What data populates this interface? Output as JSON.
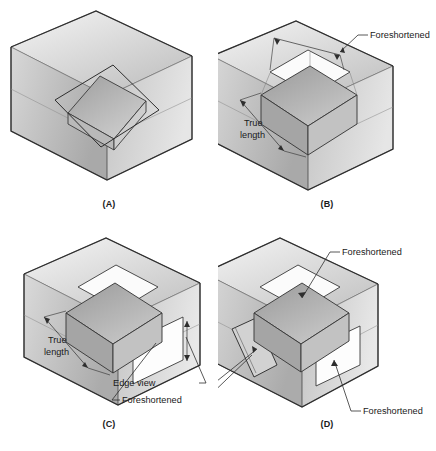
{
  "figure": {
    "background_color": "#ffffff",
    "line_color": "#333333",
    "text_color": "#1a1a1a",
    "box_fill_light": "#efefef",
    "box_fill_mid": "#c9c9c9",
    "box_fill_dark": "#a8a8a8",
    "plane_fill": "#b4b4b4",
    "projection_fill": "#fbfbfb"
  },
  "panels": [
    {
      "id": "A",
      "caption": "(A)",
      "description": "Inclined plane suspended inside glass box, no projections shown",
      "labels": []
    },
    {
      "id": "B",
      "caption": "(B)",
      "description": "Projection onto top plane is foreshortened; front projection shows true length",
      "labels": [
        {
          "name": "foreshortened",
          "text": "Foreshortened"
        },
        {
          "name": "true-length",
          "text": "True length",
          "line1": "True",
          "line2": "length"
        }
      ]
    },
    {
      "id": "C",
      "caption": "(C)",
      "description": "Front projection true length; right side projection is an edge view and foreshortened",
      "labels": [
        {
          "name": "true-length",
          "text": "True length",
          "line1": "True",
          "line2": "length"
        },
        {
          "name": "edge-view",
          "text": "Edge view"
        },
        {
          "name": "foreshortened",
          "text": "Foreshortened"
        }
      ]
    },
    {
      "id": "D",
      "caption": "(D)",
      "description": "Top and right projections foreshortened; left projection is an edge view",
      "labels": [
        {
          "name": "foreshortened-top",
          "text": "Foreshortened"
        },
        {
          "name": "edge-view",
          "text": "Edge view"
        },
        {
          "name": "foreshortened-left",
          "text": "Foreshortened"
        },
        {
          "name": "foreshortened-right",
          "text": "Foreshortened"
        }
      ]
    }
  ]
}
